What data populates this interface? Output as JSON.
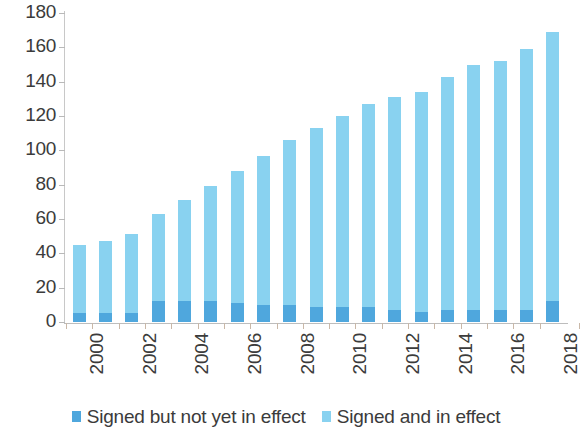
{
  "chart_data": {
    "type": "bar",
    "subtype": "stacked-vertical",
    "title": "",
    "subtitle": "",
    "xlabel": "",
    "ylabel": "",
    "ylim": [
      0,
      180
    ],
    "ytick_step": 20,
    "yticks": [
      180,
      160,
      140,
      120,
      100,
      80,
      60,
      40,
      20,
      0
    ],
    "grid": false,
    "legend_position": "bottom",
    "categories": [
      "2000",
      "2001",
      "2002",
      "2003",
      "2004",
      "2005",
      "2006",
      "2007",
      "2008",
      "2009",
      "2010",
      "2011",
      "2012",
      "2013",
      "2014",
      "2015",
      "2016",
      "2017",
      "2018"
    ],
    "xtick_labels_shown": [
      "2000",
      "2002",
      "2004",
      "2006",
      "2008",
      "2010",
      "2012",
      "2014",
      "2016",
      "2018"
    ],
    "series": [
      {
        "name": "Signed and in effect",
        "color": "#89d2f0",
        "values": [
          40,
          42,
          46,
          51,
          59,
          67,
          77,
          87,
          96,
          104,
          111,
          118,
          124,
          128,
          136,
          143,
          145,
          152,
          157
        ]
      },
      {
        "name": "Signed but not yet in effect",
        "color": "#4fa7dd",
        "values": [
          5,
          5,
          5,
          12,
          12,
          12,
          11,
          10,
          10,
          9,
          9,
          9,
          7,
          6,
          7,
          7,
          7,
          7,
          12
        ]
      }
    ],
    "totals": [
      45,
      47,
      51,
      63,
      71,
      79,
      88,
      97,
      106,
      113,
      120,
      127,
      131,
      134,
      143,
      150,
      152,
      159,
      169
    ]
  },
  "legend": {
    "items": [
      {
        "label": "Signed but not yet in effect",
        "color": "#4fa7dd"
      },
      {
        "label": "Signed and in effect",
        "color": "#89d2f0"
      }
    ]
  },
  "colors": {
    "signed_not_in_effect": "#4fa7dd",
    "signed_in_effect": "#89d2f0",
    "axis": "#c2c2c2",
    "text": "#3b3b3b",
    "background": "#ffffff"
  }
}
